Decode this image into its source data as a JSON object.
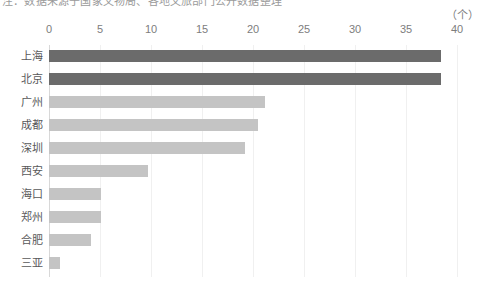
{
  "caption": {
    "text": "注：数据来源于国家文物局、各地文旅部门公开数据整理"
  },
  "unit": {
    "label": "（个）"
  },
  "chart_data": {
    "type": "bar",
    "orientation": "horizontal",
    "title": "",
    "subtitle": "",
    "xlabel": "",
    "ylabel": "",
    "unit_label": "（个）",
    "categories": [
      "上海",
      "北京",
      "广州",
      "成都",
      "深圳",
      "西安",
      "海口",
      "郑州",
      "合肥",
      "三亚"
    ],
    "values": [
      38.4,
      38.4,
      21.2,
      20.5,
      19.2,
      9.7,
      5.1,
      5.1,
      4.1,
      1.1
    ],
    "series": [
      {
        "name": "数量",
        "values": [
          38.4,
          38.4,
          21.2,
          20.5,
          19.2,
          9.7,
          5.1,
          5.1,
          4.1,
          1.1
        ]
      }
    ],
    "xlim": [
      0,
      40
    ],
    "xticks": [
      0,
      5,
      10,
      15,
      20,
      25,
      30,
      35,
      40
    ],
    "xtick_labels": [
      "0",
      "5",
      "10",
      "15",
      "20",
      "25",
      "30",
      "35",
      "40"
    ],
    "grid": true,
    "legend": false,
    "colors": {
      "bar_highlight": "#6b6b6b",
      "bar_default": "#c4c4c4",
      "gridline": "#f0f0f0",
      "axis": "#d8d8d8",
      "tick_text": "#7d7d7d",
      "category_text": "#58585a",
      "background": "#ffffff"
    },
    "bar_colors": [
      "#6b6b6b",
      "#6b6b6b",
      "#c4c4c4",
      "#c4c4c4",
      "#c4c4c4",
      "#c4c4c4",
      "#c4c4c4",
      "#c4c4c4",
      "#c4c4c4",
      "#c4c4c4"
    ]
  }
}
